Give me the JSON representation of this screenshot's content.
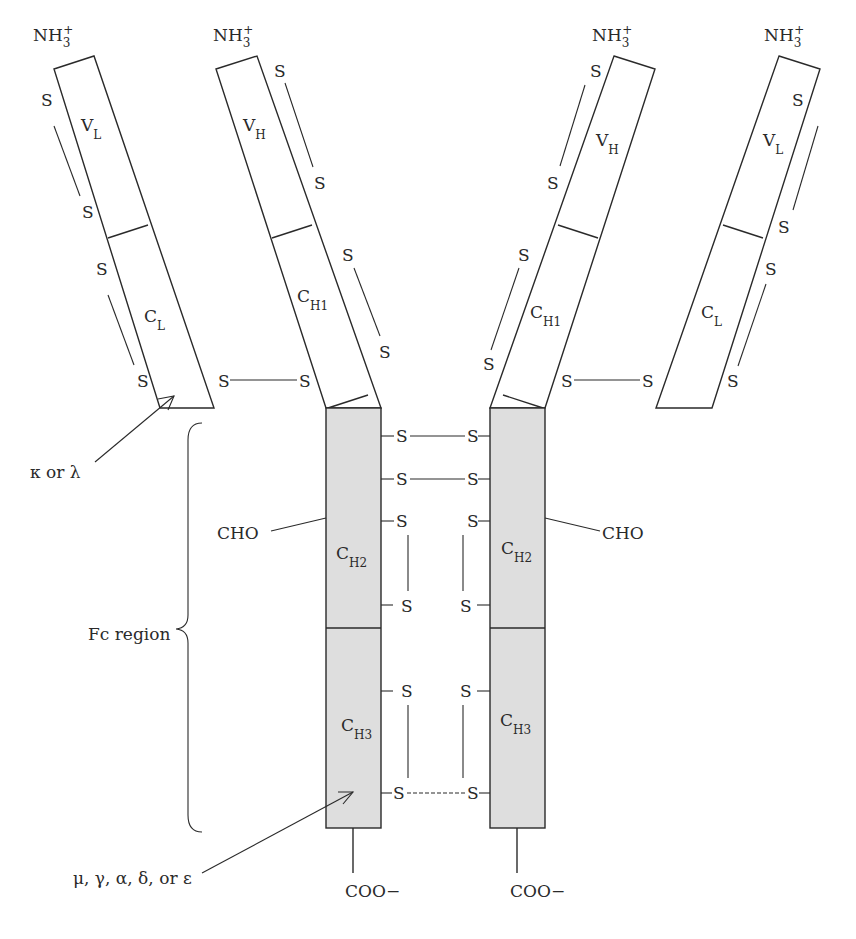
{
  "diagram": {
    "colors": {
      "line": "#2a2a2a",
      "fc_fill": "#dedede",
      "background": "#ffffff"
    },
    "termini": {
      "n_terminus": {
        "main": "NH",
        "sub": "3",
        "sup": "+"
      },
      "c_terminus": "COO−"
    },
    "domains": {
      "vl": {
        "main": "V",
        "sub": "L"
      },
      "vh": {
        "main": "V",
        "sub": "H"
      },
      "cl": {
        "main": "C",
        "sub": "L"
      },
      "ch1": {
        "main": "C",
        "sub": "H1"
      },
      "ch2": {
        "main": "C",
        "sub": "H2"
      },
      "ch3": {
        "main": "C",
        "sub": "H3"
      }
    },
    "sulfur": "S",
    "labels": {
      "light_chain_type": "κ or λ",
      "fc_region": "Fc region",
      "carbohydrate": "CHO",
      "heavy_chain_type": "μ, γ, α, δ, or  ε"
    }
  }
}
